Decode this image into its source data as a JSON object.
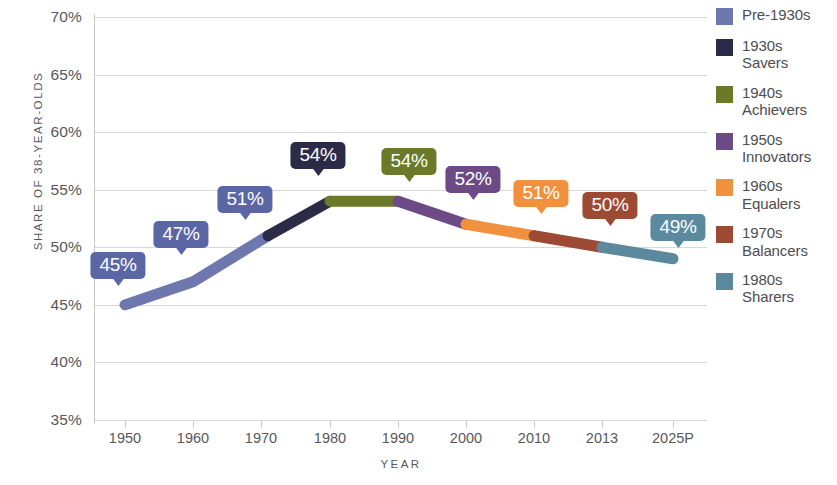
{
  "chart_data": {
    "type": "line",
    "title": "",
    "xlabel": "YEAR",
    "ylabel": "SHARE OF 38-YEAR-OLDS",
    "ylim": [
      35,
      70
    ],
    "ytick_labels": [
      "70%",
      "65%",
      "60%",
      "55%",
      "50%",
      "45%",
      "40%",
      "35%"
    ],
    "ytick_values": [
      70,
      65,
      60,
      55,
      50,
      45,
      40,
      35
    ],
    "xtick_labels": [
      "1950",
      "1960",
      "1970",
      "1980",
      "1990",
      "2000",
      "2010",
      "2013",
      "2025P"
    ],
    "grid": "horizontal",
    "legend_position": "right",
    "categories": [
      "1950",
      "1960",
      "1968",
      "1980",
      "1990",
      "2000",
      "2010",
      "2013",
      "2025P"
    ],
    "values": [
      45,
      47,
      51,
      54,
      54,
      52,
      51,
      50,
      49
    ],
    "point_labels": [
      "45%",
      "47%",
      "51%",
      "54%",
      "54%",
      "52%",
      "51%",
      "50%",
      "49%"
    ],
    "series": [
      {
        "name": "Pre-1930s",
        "color": "#6E78AE",
        "values": [
          45,
          47,
          51,
          null,
          null,
          null,
          null,
          null,
          null
        ]
      },
      {
        "name": "1930s Savers",
        "color": "#2B2B47",
        "values": [
          null,
          null,
          51,
          54,
          null,
          null,
          null,
          null,
          null
        ]
      },
      {
        "name": "1940s Achievers",
        "color": "#6B7A28",
        "values": [
          null,
          null,
          null,
          54,
          54,
          null,
          null,
          null,
          null
        ]
      },
      {
        "name": "1950s Innovators",
        "color": "#6B4A86",
        "values": [
          null,
          null,
          null,
          null,
          54,
          52,
          null,
          null,
          null
        ]
      },
      {
        "name": "1960s Equalers",
        "color": "#F2913D",
        "values": [
          null,
          null,
          null,
          null,
          null,
          52,
          51,
          null,
          null
        ]
      },
      {
        "name": "1970s Balancers",
        "color": "#9C4A33",
        "values": [
          null,
          null,
          null,
          null,
          null,
          null,
          51,
          50,
          null
        ]
      },
      {
        "name": "1980s Sharers",
        "color": "#5B8A9E",
        "values": [
          null,
          null,
          null,
          null,
          null,
          null,
          null,
          50,
          49
        ]
      }
    ]
  },
  "axes": {
    "y_title": "SHARE OF 38-YEAR-OLDS",
    "x_title": "YEAR",
    "y_ticks": [
      {
        "label": "70%",
        "value": 70
      },
      {
        "label": "65%",
        "value": 65
      },
      {
        "label": "60%",
        "value": 60
      },
      {
        "label": "55%",
        "value": 55
      },
      {
        "label": "50%",
        "value": 50
      },
      {
        "label": "45%",
        "value": 45
      },
      {
        "label": "40%",
        "value": 40
      },
      {
        "label": "35%",
        "value": 35
      }
    ],
    "x_ticks": [
      {
        "label": "1950"
      },
      {
        "label": "1960"
      },
      {
        "label": "1970"
      },
      {
        "label": "1980"
      },
      {
        "label": "1990"
      },
      {
        "label": "2000"
      },
      {
        "label": "2010"
      },
      {
        "label": "2013"
      },
      {
        "label": "2025P"
      }
    ]
  },
  "callouts": [
    {
      "label": "45%",
      "color": "#5B66A5",
      "x": 118,
      "y": 252
    },
    {
      "label": "47%",
      "color": "#5B66A5",
      "x": 181,
      "y": 221
    },
    {
      "label": "51%",
      "color": "#5B66A5",
      "x": 245,
      "y": 186
    },
    {
      "label": "54%",
      "color": "#2B2B47",
      "x": 318,
      "y": 142
    },
    {
      "label": "54%",
      "color": "#6B7A28",
      "x": 409,
      "y": 148
    },
    {
      "label": "52%",
      "color": "#6B4A86",
      "x": 473,
      "y": 166
    },
    {
      "label": "51%",
      "color": "#F2913D",
      "x": 541,
      "y": 180
    },
    {
      "label": "50%",
      "color": "#9C4A33",
      "x": 610,
      "y": 192
    },
    {
      "label": "49%",
      "color": "#5B8A9E",
      "x": 678,
      "y": 214
    }
  ],
  "legend": {
    "items": [
      {
        "color": "#6E78AE",
        "label": "Pre-1930s"
      },
      {
        "color": "#2B2B47",
        "label": "1930s\nSavers"
      },
      {
        "color": "#6B7A28",
        "label": "1940s\nAchievers"
      },
      {
        "color": "#6B4A86",
        "label": "1950s\nInnovators"
      },
      {
        "color": "#F2913D",
        "label": "1960s\nEqualers"
      },
      {
        "color": "#9C4A33",
        "label": "1970s\nBalancers"
      },
      {
        "color": "#5B8A9E",
        "label": "1980s\nSharers"
      }
    ]
  }
}
